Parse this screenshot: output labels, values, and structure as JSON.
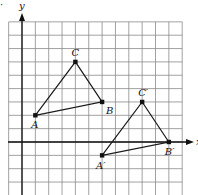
{
  "figure": {
    "type": "coordinate-grid-translation",
    "grid": {
      "x_min": -1,
      "x_max": 12,
      "y_min": -4,
      "y_max": 9,
      "unit_px": 13.35,
      "origin_px": [
        22,
        142
      ],
      "grid_color": "#8a8a8a",
      "axis_color": "#111111"
    },
    "axes": {
      "x_label": "x",
      "y_label": "y"
    },
    "triangles": [
      {
        "name": "ABC",
        "vertices": [
          {
            "label": "A",
            "x": 1,
            "y": 2
          },
          {
            "label": "B",
            "x": 6,
            "y": 3
          },
          {
            "label": "C",
            "x": 4,
            "y": 6
          }
        ]
      },
      {
        "name": "A'B'C'",
        "vertices": [
          {
            "label": "A′",
            "x": 6,
            "y": -1
          },
          {
            "label": "B′",
            "x": 11,
            "y": 0
          },
          {
            "label": "C′",
            "x": 9,
            "y": 3
          }
        ]
      }
    ],
    "corner_mark": "·"
  }
}
